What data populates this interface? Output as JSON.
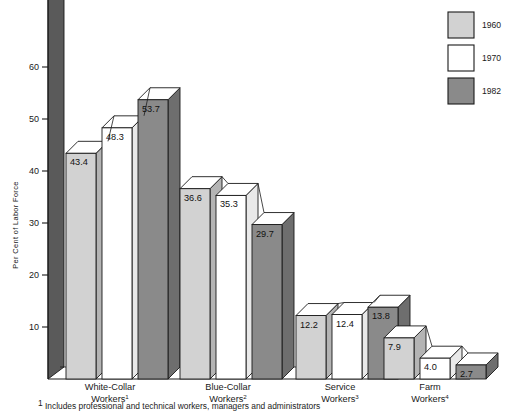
{
  "chart_data": {
    "type": "bar",
    "title": "",
    "xlabel": "",
    "ylabel": "Per Cent of Labor Force",
    "ylim": [
      0,
      70
    ],
    "yticks": [
      10,
      20,
      30,
      40,
      50,
      60
    ],
    "ytick_labels": [
      "10",
      "20",
      "30",
      "40",
      "50",
      "60"
    ],
    "grid": false,
    "legend_position": "top-right",
    "categories": [
      "White-Collar Workers",
      "Blue-Collar Workers",
      "Service Workers",
      "Farm Workers"
    ],
    "category_lines": [
      {
        "line1": "White-Collar",
        "line2": "Workers",
        "sup": "1"
      },
      {
        "line1": "Blue-Collar",
        "line2": "Workers",
        "sup": "2"
      },
      {
        "line1": "Service",
        "line2": "Workers",
        "sup": "3"
      },
      {
        "line1": "Farm",
        "line2": "Workers",
        "sup": "4"
      }
    ],
    "series": [
      {
        "name": "1960",
        "color": "#d2d2d2",
        "values": [
          43.4,
          36.6,
          12.2,
          7.9
        ]
      },
      {
        "name": "1970",
        "color": "#ffffff",
        "values": [
          48.3,
          35.3,
          12.4,
          4.0
        ]
      },
      {
        "name": "1982",
        "color": "#8a8a8a",
        "values": [
          53.7,
          29.7,
          13.8,
          2.7
        ]
      }
    ],
    "data_labels": [
      [
        "43.4",
        "48.3",
        "53.7"
      ],
      [
        "36.6",
        "35.3",
        "29.7"
      ],
      [
        "12.2",
        "12.4",
        "13.8"
      ],
      [
        "7.9",
        "4.0",
        "2.7"
      ]
    ]
  },
  "legend": {
    "items": [
      {
        "label": "1960",
        "color": "#d2d2d2"
      },
      {
        "label": "1970",
        "color": "#ffffff"
      },
      {
        "label": "1982",
        "color": "#8a8a8a"
      }
    ]
  },
  "footnotes": [
    {
      "marker": "1",
      "text": "Includes professional and technical workers, managers and administrators"
    }
  ],
  "colors": {
    "series_1960": "#d2d2d2",
    "series_1970": "#ffffff",
    "series_1982": "#8a8a8a",
    "series_1982_side": "#6e6e6e",
    "axis_wall": "#5a5a5a",
    "stroke": "#1a1a1a",
    "background": "#ffffff"
  }
}
